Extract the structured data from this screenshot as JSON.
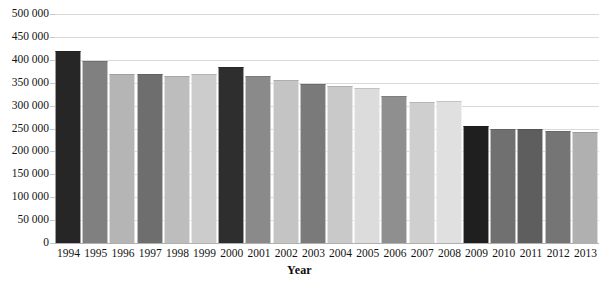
{
  "chart_data": {
    "type": "bar",
    "title": "",
    "xlabel": "Year",
    "ylabel": "",
    "grid": true,
    "legend": "none",
    "ylim": [
      0,
      500000
    ],
    "ytick_values": [
      0,
      50000,
      100000,
      150000,
      200000,
      250000,
      300000,
      350000,
      400000,
      450000,
      500000
    ],
    "ytick_labels": [
      "0",
      "50 000",
      "100 000",
      "150 000",
      "200 000",
      "250 000",
      "300 000",
      "350 000",
      "400 000",
      "450 000",
      "500 000"
    ],
    "categories": [
      "1994",
      "1995",
      "1996",
      "1997",
      "1998",
      "1999",
      "2000",
      "2001",
      "2002",
      "2003",
      "2004",
      "2005",
      "2006",
      "2007",
      "2008",
      "2009",
      "2010",
      "2011",
      "2012",
      "2013"
    ],
    "values": [
      420000,
      397000,
      369000,
      370000,
      365000,
      369000,
      384000,
      365000,
      357000,
      348000,
      342000,
      339000,
      320000,
      308000,
      310000,
      256000,
      250000,
      250000,
      244000,
      243000
    ],
    "bar_colors": [
      "#262626",
      "#808080",
      "#b5b5b5",
      "#6e6e6e",
      "#bdbdbd",
      "#cccccc",
      "#2e2e2e",
      "#8a8a8a",
      "#c4c4c4",
      "#7a7a7a",
      "#c9c9c9",
      "#dcdcdc",
      "#8f8f8f",
      "#cfcfcf",
      "#e0e0e0",
      "#1f1f1f",
      "#707070",
      "#5e5e5e",
      "#757575",
      "#b0b0b0"
    ]
  },
  "axis": {
    "x_title": "Year"
  }
}
